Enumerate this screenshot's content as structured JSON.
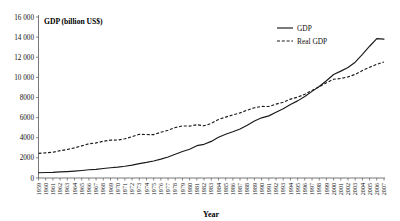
{
  "chart_data": {
    "type": "line",
    "title": "GDP (billion US$)",
    "xlabel": "Year",
    "ylabel": "GDP (billion US$)",
    "ylim": [
      0,
      16000
    ],
    "ytick_step": 2000,
    "yticks": [
      "0",
      "2000",
      "4000",
      "6000",
      "8000",
      "10 000",
      "12 000",
      "14 000",
      "16 000"
    ],
    "grid": false,
    "legend_position": "top-right",
    "legend": [
      "GDP",
      "Real GDP"
    ],
    "categories": [
      "1959",
      "1960",
      "1961",
      "1962",
      "1963",
      "1964",
      "1965",
      "1966",
      "1967",
      "1968",
      "1969",
      "1970",
      "1971",
      "1972",
      "1973",
      "1974",
      "1975",
      "1976",
      "1977",
      "1978",
      "1979",
      "1980",
      "1981",
      "1982",
      "1983",
      "1984",
      "1985",
      "1986",
      "1987",
      "1988",
      "1989",
      "1990",
      "1991",
      "1992",
      "1993",
      "1994",
      "1995",
      "1996",
      "1997",
      "1998",
      "1999",
      "2000",
      "2001",
      "2002",
      "2003",
      "2004",
      "2005",
      "2006",
      "2007"
    ],
    "series": [
      {
        "name": "GDP",
        "style": "solid",
        "values": [
          522,
          543,
          563,
          605,
          638,
          685,
          743,
          815,
          862,
          943,
          1020,
          1076,
          1168,
          1282,
          1429,
          1549,
          1689,
          1878,
          2086,
          2357,
          2632,
          2863,
          3211,
          3345,
          3638,
          4041,
          4347,
          4590,
          4870,
          5253,
          5658,
          5980,
          6174,
          6539,
          6879,
          7309,
          7664,
          8100,
          8609,
          9089,
          9661,
          10285,
          10622,
          10978,
          11511,
          12275,
          13094,
          13856,
          13808
        ]
      },
      {
        "name": "Real GDP",
        "style": "dashed",
        "values": [
          2442,
          2502,
          2560,
          2715,
          2834,
          2999,
          3192,
          3400,
          3485,
          3653,
          3765,
          3772,
          3899,
          4105,
          4342,
          4320,
          4311,
          4541,
          4751,
          5015,
          5173,
          5162,
          5292,
          5189,
          5424,
          5814,
          6054,
          6264,
          6475,
          6743,
          6981,
          7113,
          7101,
          7337,
          7533,
          7836,
          8032,
          8329,
          8704,
          9067,
          9470,
          9817,
          9891,
          10049,
          10301,
          10676,
          11003,
          11295,
          11524
        ]
      }
    ]
  }
}
